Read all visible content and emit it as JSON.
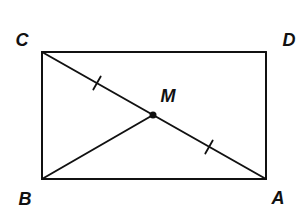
{
  "diagram": {
    "type": "geometry",
    "colors": {
      "stroke": "#111111",
      "background": "#ffffff"
    },
    "points": {
      "C": {
        "label": "C",
        "x": 42,
        "y": 52,
        "label_x": 22,
        "label_y": 46
      },
      "D": {
        "label": "D",
        "x": 266,
        "y": 52,
        "label_x": 289,
        "label_y": 46
      },
      "B": {
        "label": "B",
        "x": 42,
        "y": 179,
        "label_x": 25,
        "label_y": 205
      },
      "A": {
        "label": "A",
        "x": 266,
        "y": 179,
        "label_x": 278,
        "label_y": 204
      },
      "M": {
        "label": "M",
        "x": 153,
        "y": 115,
        "label_x": 168,
        "label_y": 102
      }
    },
    "segments": [
      {
        "from": "C",
        "to": "D",
        "name": "CD"
      },
      {
        "from": "D",
        "to": "A",
        "name": "DA"
      },
      {
        "from": "A",
        "to": "B",
        "name": "AB"
      },
      {
        "from": "B",
        "to": "C",
        "name": "BC"
      },
      {
        "from": "C",
        "to": "A",
        "name": "CA"
      },
      {
        "from": "B",
        "to": "M",
        "name": "BM"
      }
    ],
    "congruence_marks": [
      {
        "segment": "CM",
        "ticks": 1,
        "x": 97,
        "y": 83
      },
      {
        "segment": "MA",
        "ticks": 1,
        "x": 209,
        "y": 147
      }
    ],
    "labels": {
      "C": "C",
      "D": "D",
      "B": "B",
      "A": "A",
      "M": "M"
    }
  }
}
